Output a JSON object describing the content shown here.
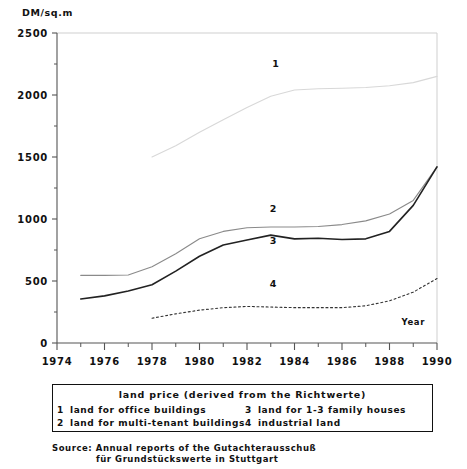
{
  "chart_data": {
    "type": "line",
    "title": "land price (derived from the Richtwerte)",
    "xlabel": "Year",
    "ylabel": "DM/sq.m",
    "xlim": [
      1974,
      1990
    ],
    "ylim": [
      0,
      2500
    ],
    "grid": false,
    "legend_position": "below-plot",
    "y_ticks": [
      0,
      500,
      1000,
      1500,
      2000,
      2500
    ],
    "y_tick_labels": [
      "0",
      "500",
      "1000",
      "1500",
      "2000",
      "2500"
    ],
    "y_minor_tick_step": 250,
    "x_ticks": [
      1974,
      1976,
      1978,
      1980,
      1982,
      1984,
      1986,
      1988,
      1990
    ],
    "x_tick_labels": [
      "1974",
      "1976",
      "1978",
      "1980",
      "1982",
      "1984",
      "1986",
      "1988",
      "1990"
    ],
    "x_minor_tick_step": 1,
    "series": [
      {
        "key": "1",
        "name": "land for office buildings",
        "color": "#d8d8d8",
        "style": "solid",
        "width": 1.1,
        "label_x": 1983.2,
        "label_y": 2225,
        "x": [
          1978,
          1979,
          1980,
          1981,
          1982,
          1983,
          1984,
          1985,
          1986,
          1987,
          1988,
          1989,
          1990
        ],
        "values": [
          1500,
          1590,
          1700,
          1800,
          1900,
          1990,
          2040,
          2050,
          2055,
          2060,
          2075,
          2100,
          2150
        ]
      },
      {
        "key": "2",
        "name": "land for multi-tenant buildings",
        "color": "#8a8a8a",
        "style": "solid",
        "width": 1.1,
        "label_x": 1983.1,
        "label_y": 1060,
        "x": [
          1975,
          1976,
          1977,
          1978,
          1979,
          1980,
          1981,
          1982,
          1983,
          1984,
          1985,
          1986,
          1987,
          1988,
          1989,
          1990
        ],
        "values": [
          545,
          545,
          548,
          615,
          720,
          840,
          900,
          930,
          935,
          935,
          940,
          955,
          985,
          1040,
          1150,
          1420
        ]
      },
      {
        "key": "3",
        "name": "land for 1-3 family houses",
        "color": "#222222",
        "style": "solid",
        "width": 1.6,
        "label_x": 1983.1,
        "label_y": 800,
        "x": [
          1975,
          1976,
          1977,
          1978,
          1979,
          1980,
          1981,
          1982,
          1983,
          1984,
          1985,
          1986,
          1987,
          1988,
          1989,
          1990
        ],
        "values": [
          355,
          380,
          420,
          470,
          580,
          700,
          790,
          830,
          870,
          840,
          845,
          835,
          840,
          900,
          1110,
          1420
        ]
      },
      {
        "key": "4",
        "name": "industrial land",
        "color": "#333333",
        "style": "dotted",
        "width": 1.1,
        "label_x": 1983.1,
        "label_y": 450,
        "x": [
          1978,
          1979,
          1980,
          1981,
          1982,
          1983,
          1984,
          1985,
          1986,
          1987,
          1988,
          1989,
          1990
        ],
        "values": [
          200,
          235,
          265,
          285,
          295,
          290,
          285,
          285,
          285,
          300,
          340,
          410,
          520
        ]
      }
    ]
  },
  "legend": {
    "title": "land price (derived from the Richtwerte)",
    "entries": [
      {
        "key": "1",
        "label": "land for office buildings"
      },
      {
        "key": "3",
        "label": "land for 1-3 family houses"
      },
      {
        "key": "2",
        "label": "land for multi-tenant buildings"
      },
      {
        "key": "4",
        "label": "industrial land"
      }
    ]
  },
  "source": {
    "line1": "Source: Annual reports of the Gutachterausschuß",
    "line2": "für Grundstückswerte in Stuttgart"
  },
  "colors": {
    "axis": "#555555",
    "plot_border": "#cfcfcf",
    "text": "#111111",
    "background": "#ffffff"
  }
}
